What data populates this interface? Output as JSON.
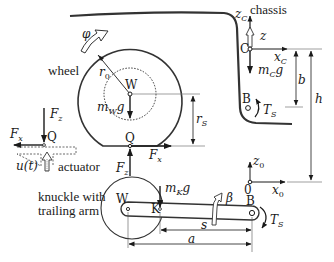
{
  "diagram": {
    "components": {
      "chassis": "chassis",
      "wheel": "wheel",
      "actuator": "actuator",
      "knuckle_line1": "knuckle with",
      "knuckle_line2": "trailing arm"
    },
    "points": {
      "W_top": "W",
      "Q_contact": "Q",
      "Q_left": "Q",
      "C": "C",
      "B_chassis": "B",
      "origin": "0",
      "W_knuckle": "W",
      "K": "K",
      "B_arm": "B"
    },
    "symbols": {
      "phi": "φ",
      "r0_main": "r",
      "r0_sub": "0",
      "mWg_m": "m",
      "mWg_sub": "W",
      "mWg_g": "g",
      "rS_main": "r",
      "rS_sub": "S",
      "Fz_main": "F",
      "Fz_sub": "z",
      "Fx_main": "F",
      "Fx_sub": "x",
      "u_t": "u(t)",
      "zC_main": "z",
      "zC_sub": "C",
      "z": "z",
      "xC_main": "x",
      "xC_sub": "C",
      "mCg_m": "m",
      "mCg_sub": "C",
      "mCg_g": "g",
      "b": "b",
      "h": "h",
      "TS_main": "T",
      "TS_sub": "S",
      "z0_main": "z",
      "z0_sub": "0",
      "x0_main": "x",
      "x0_sub": "0",
      "mKg_m": "m",
      "mKg_sub": "K",
      "mKg_g": "g",
      "beta": "β",
      "s": "s",
      "a": "a"
    },
    "colors": {
      "line": "#1a1a1a",
      "thin": "#555555",
      "background": "#ffffff"
    }
  }
}
